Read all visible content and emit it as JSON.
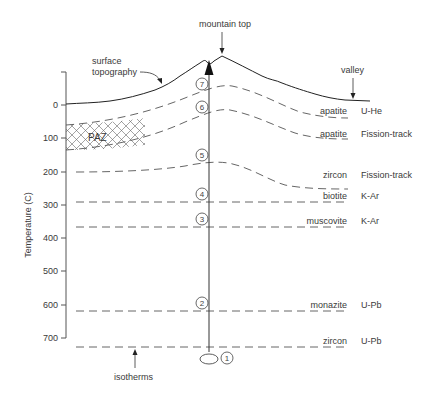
{
  "diagram": {
    "type": "thermochronology-isotherm-diagram",
    "labels": {
      "mountain_top": "mountain top",
      "surface_topography_line1": "surface",
      "surface_topography_line2": "topography",
      "valley": "valley",
      "isotherms": "isotherms",
      "paz": "PAZ",
      "y_axis": "Temperature (C)"
    },
    "y_axis": {
      "ticks": [
        "0",
        "100",
        "200",
        "300",
        "400",
        "500",
        "600",
        "700"
      ]
    },
    "markers": [
      "1",
      "2",
      "3",
      "4",
      "5",
      "6",
      "7"
    ],
    "systems": [
      {
        "mineral": "apatite",
        "method": "U-He"
      },
      {
        "mineral": "apatite",
        "method": "Fission-track"
      },
      {
        "mineral": "zircon",
        "method": "Fission-track"
      },
      {
        "mineral": "biotite",
        "method": "K-Ar"
      },
      {
        "mineral": "muscovite",
        "method": "K-Ar"
      },
      {
        "mineral": "monazite",
        "method": "U-Pb"
      },
      {
        "mineral": "zircon",
        "method": "U-Pb"
      }
    ],
    "colors": {
      "line": "#333333",
      "dashed": "#555555",
      "text": "#3a3a3a"
    }
  }
}
